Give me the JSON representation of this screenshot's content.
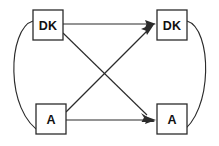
{
  "diagram": {
    "type": "cross-lagged-panel",
    "canvas": {
      "width": 219,
      "height": 146
    },
    "style": {
      "background_color": "#ffffff",
      "line_color": "#2b2b2b",
      "box_fill": "#ffffff",
      "box_stroke": "#2b2b2b",
      "label_color": "#111111"
    },
    "nodes": [
      {
        "id": "dk-top-left",
        "label": "DK",
        "x": 33,
        "y": 10,
        "width": 30,
        "height": 30,
        "position": "top-left"
      },
      {
        "id": "dk-top-right",
        "label": "DK",
        "x": 157,
        "y": 10,
        "width": 30,
        "height": 30,
        "position": "top-right"
      },
      {
        "id": "a-bottom-left",
        "label": "A",
        "x": 36,
        "y": 104,
        "width": 30,
        "height": 30,
        "position": "bottom-left"
      },
      {
        "id": "a-bottom-right",
        "label": "A",
        "x": 157,
        "y": 104,
        "width": 30,
        "height": 30,
        "position": "bottom-right"
      }
    ],
    "edges": [
      {
        "id": "edge-dk-to-dk",
        "from": "dk-top-left",
        "to": "dk-top-right",
        "kind": "straight",
        "arrow": "to",
        "description": "horizontal autoregressive path top"
      },
      {
        "id": "edge-a-to-a",
        "from": "a-bottom-left",
        "to": "a-bottom-right",
        "kind": "straight",
        "arrow": "to",
        "description": "horizontal autoregressive path bottom"
      },
      {
        "id": "edge-dk-to-a",
        "from": "dk-top-left",
        "to": "a-bottom-right",
        "kind": "diagonal",
        "arrow": "to",
        "description": "cross-lagged path descending"
      },
      {
        "id": "edge-a-to-dk",
        "from": "a-bottom-left",
        "to": "dk-top-right",
        "kind": "diagonal",
        "arrow": "to",
        "description": "cross-lagged path ascending"
      },
      {
        "id": "edge-left-arc",
        "from": "dk-top-left",
        "to": "a-bottom-left",
        "kind": "arc",
        "arrow": "none",
        "description": "left curved covariance arc"
      },
      {
        "id": "edge-right-arc",
        "from": "dk-top-right",
        "to": "a-bottom-right",
        "kind": "arc",
        "arrow": "none",
        "description": "right curved covariance arc"
      }
    ]
  }
}
